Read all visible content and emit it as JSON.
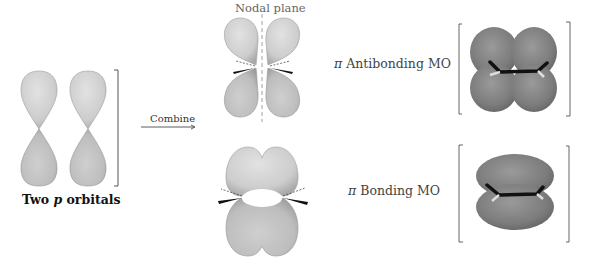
{
  "diagram": {
    "left": {
      "caption_prefix": "Two ",
      "caption_italic": "p",
      "caption_suffix": " orbitals",
      "lobe_color": "#c8c8c8"
    },
    "arrow": {
      "label": "Combine"
    },
    "antibonding": {
      "nodal_label": "Nodal plane",
      "name_symbol": "π",
      "name_text": " Antibonding MO",
      "model_color": "#7f7f7f"
    },
    "bonding": {
      "name_symbol": "π",
      "name_text": " Bonding MO",
      "model_color": "#808080"
    },
    "colors": {
      "lobe_light": "#d4d4d4",
      "lobe_dark": "#b9b9b9",
      "mo_gray": "#7a7a7a",
      "bond_black": "#111111",
      "bracket": "#555555",
      "text": "#444444"
    }
  }
}
